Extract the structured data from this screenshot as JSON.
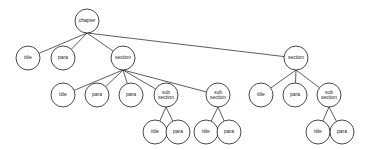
{
  "diagram": {
    "type": "tree",
    "title": "",
    "node_radius": 12,
    "nodes": [
      {
        "id": "chapter",
        "label": [
          "chapter"
        ],
        "x": 87,
        "y": 21
      },
      {
        "id": "title1",
        "label": [
          "title"
        ],
        "x": 28,
        "y": 58
      },
      {
        "id": "para1",
        "label": [
          "para"
        ],
        "x": 63,
        "y": 58
      },
      {
        "id": "sectionA",
        "label": [
          "section"
        ],
        "x": 123,
        "y": 58
      },
      {
        "id": "sectionB",
        "label": [
          "section"
        ],
        "x": 296,
        "y": 58
      },
      {
        "id": "titleA",
        "label": [
          "title"
        ],
        "x": 63,
        "y": 95
      },
      {
        "id": "paraA1",
        "label": [
          "para"
        ],
        "x": 97,
        "y": 95
      },
      {
        "id": "paraA2",
        "label": [
          "para"
        ],
        "x": 131,
        "y": 95
      },
      {
        "id": "subA1",
        "label": [
          "sub",
          "section"
        ],
        "x": 166,
        "y": 95
      },
      {
        "id": "subA2",
        "label": [
          "sub",
          "section"
        ],
        "x": 218,
        "y": 95
      },
      {
        "id": "titleB",
        "label": [
          "title"
        ],
        "x": 261,
        "y": 95
      },
      {
        "id": "paraB",
        "label": [
          "para"
        ],
        "x": 295,
        "y": 95
      },
      {
        "id": "subB",
        "label": [
          "sub",
          "section"
        ],
        "x": 329,
        "y": 95
      },
      {
        "id": "titleA1",
        "label": [
          "title"
        ],
        "x": 155,
        "y": 132
      },
      {
        "id": "paraA1s",
        "label": [
          "para"
        ],
        "x": 178,
        "y": 132
      },
      {
        "id": "titleA2",
        "label": [
          "title"
        ],
        "x": 206,
        "y": 132
      },
      {
        "id": "paraA2s",
        "label": [
          "para"
        ],
        "x": 229,
        "y": 132
      },
      {
        "id": "titleB1",
        "label": [
          "title"
        ],
        "x": 318,
        "y": 132
      },
      {
        "id": "paraB1",
        "label": [
          "para"
        ],
        "x": 342,
        "y": 132
      }
    ],
    "edges": [
      [
        "chapter",
        "title1"
      ],
      [
        "chapter",
        "para1"
      ],
      [
        "chapter",
        "sectionA"
      ],
      [
        "chapter",
        "sectionB"
      ],
      [
        "sectionA",
        "titleA"
      ],
      [
        "sectionA",
        "paraA1"
      ],
      [
        "sectionA",
        "paraA2"
      ],
      [
        "sectionA",
        "subA1"
      ],
      [
        "sectionA",
        "subA2"
      ],
      [
        "sectionB",
        "titleB"
      ],
      [
        "sectionB",
        "paraB"
      ],
      [
        "sectionB",
        "subB"
      ],
      [
        "subA1",
        "titleA1"
      ],
      [
        "subA1",
        "paraA1s"
      ],
      [
        "subA2",
        "titleA2"
      ],
      [
        "subA2",
        "paraA2s"
      ],
      [
        "subB",
        "titleB1"
      ],
      [
        "subB",
        "paraB1"
      ]
    ]
  }
}
